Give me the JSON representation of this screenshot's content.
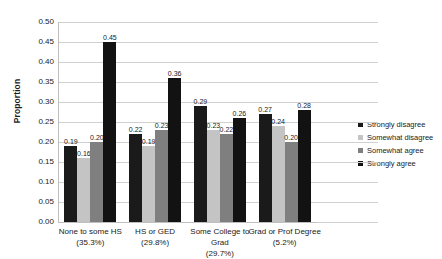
{
  "chart_data": {
    "type": "bar",
    "title": "",
    "xlabel": "",
    "ylabel": "Proportion",
    "ylim": [
      0.0,
      0.5
    ],
    "ytick_step": 0.05,
    "grid": true,
    "legend_position": "right",
    "categories": [
      "None to some HS",
      "HS or GED",
      "Some College to Grad",
      "Grad or Prof Degree"
    ],
    "category_percents": [
      "(35.3%)",
      "(29.8%)",
      "(29.7%)",
      "(5.2%)"
    ],
    "ytick_labels": [
      "0.50",
      "0.45",
      "0.40",
      "0.35",
      "0.30",
      "0.25",
      "0.20",
      "0.15",
      "0.10",
      "0.05",
      "0.00"
    ],
    "series": [
      {
        "name": "Strongly disagree",
        "color": "#1a1a1a",
        "values": [
          0.19,
          0.22,
          0.29,
          0.27
        ],
        "labels": [
          "0.19",
          "0.22",
          "0.29",
          "0.27"
        ]
      },
      {
        "name": "Somewhat disagree",
        "color": "#c4c4c4",
        "values": [
          0.16,
          0.19,
          0.23,
          0.24
        ],
        "labels": [
          "0.16",
          "0.19",
          "0.23",
          "0.24"
        ]
      },
      {
        "name": "Somewhat agree",
        "color": "#7f7f7f",
        "values": [
          0.2,
          0.23,
          0.22,
          0.2
        ],
        "labels": [
          "0.20",
          "0.23",
          "0.22",
          "0.20"
        ]
      },
      {
        "name": "Strongly agree",
        "color": "#121212",
        "values": [
          0.45,
          0.36,
          0.26,
          0.28
        ],
        "labels": [
          "0.45",
          "0.36",
          "0.26",
          "0.28"
        ]
      }
    ]
  }
}
